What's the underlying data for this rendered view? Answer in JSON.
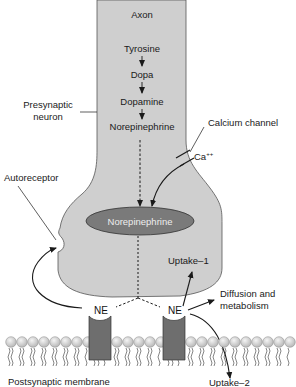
{
  "diagram": {
    "axon_label": "Axon",
    "synthesis_pathway": [
      "Tyrosine",
      "Dopa",
      "Dopamine",
      "Norepinephrine"
    ],
    "vesicle_label": "Norepinephrine",
    "presynaptic_label_line1": "Presynaptic",
    "presynaptic_label_line2": "neuron",
    "calcium_channel_label": "Calcium channel",
    "calcium_ion": "Ca",
    "calcium_charge": "++",
    "autoreceptor_label": "Autoreceptor",
    "uptake1_label": "Uptake–1",
    "diffusion_line1": "Diffusion and",
    "diffusion_line2": "metabolism",
    "ne_left": "NE",
    "ne_right": "NE",
    "uptake2_label": "Uptake–2",
    "membrane_label": "Postsynaptic membrane"
  },
  "colors": {
    "neuron_fill": "#cfcfcf",
    "vesicle_fill": "#7a7a7a",
    "receptor_fill": "#6e6e6e",
    "lipid_head": "#d6d6d6",
    "line": "#1a1a1a"
  }
}
